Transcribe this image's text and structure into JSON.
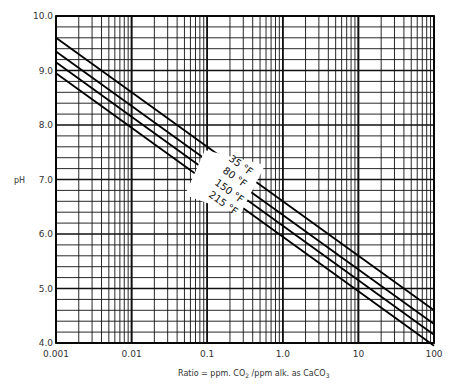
{
  "chart_data": {
    "type": "line",
    "title": "",
    "xlabel": "Ratio = ppm CO2 / ppm alk. as CaCO3",
    "ylabel": "pH",
    "xscale": "log",
    "xlim": [
      0.001,
      100
    ],
    "ylim": [
      4.0,
      10.0
    ],
    "x_ticks": [
      0.001,
      0.01,
      0.1,
      1.0,
      10,
      100
    ],
    "x_tick_labels": [
      "0.001",
      "0.01",
      "0.1",
      "1.0",
      "10",
      "100"
    ],
    "y_ticks": [
      4.0,
      5.0,
      6.0,
      7.0,
      8.0,
      9.0,
      10.0
    ],
    "y_tick_labels": [
      "4.0",
      "5.0",
      "6.0",
      "7.0",
      "8.0",
      "9.0",
      "10.0"
    ],
    "grid": true,
    "x": [
      0.001,
      100
    ],
    "series": [
      {
        "name": "35 °F",
        "values": [
          9.6,
          4.6
        ]
      },
      {
        "name": "80 °F",
        "values": [
          9.35,
          4.35
        ]
      },
      {
        "name": "150 °F",
        "values": [
          9.15,
          4.15
        ]
      },
      {
        "name": "215 °F",
        "values": [
          8.95,
          3.95
        ]
      }
    ],
    "legend_position": "inline, center along lines"
  }
}
